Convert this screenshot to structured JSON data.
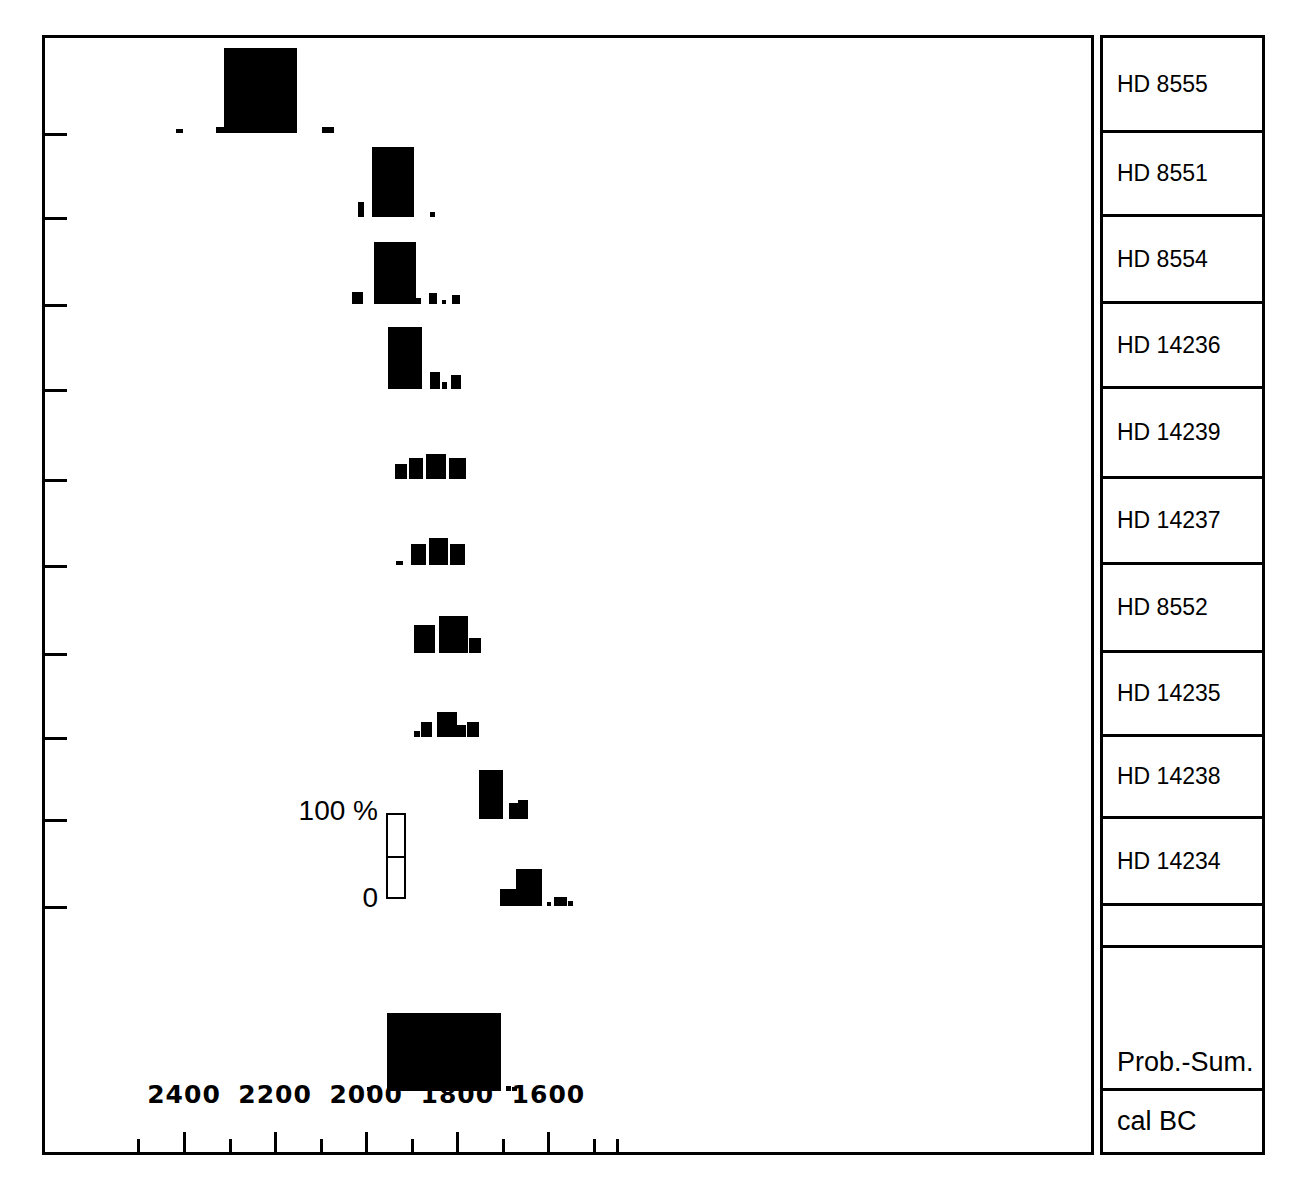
{
  "chart_data": {
    "type": "bar",
    "title": "",
    "subtitle": "",
    "xlabel": "cal BC",
    "ylabel": "",
    "xlim": [
      2500,
      1450
    ],
    "x_axis_direction": "reversed",
    "xticks_major": [
      2400,
      2200,
      2000,
      1800,
      1600
    ],
    "xticks_minor": [
      2300,
      2100,
      1900,
      1700,
      1500
    ],
    "grid": false,
    "legend_position": "inside-left",
    "scale_legend": {
      "top_label": "100 %",
      "bottom_label": "0",
      "midline": true
    },
    "series": [
      {
        "name": "HD 8555",
        "bars": [
          {
            "start": 2418,
            "end": 2403,
            "prob": 4
          },
          {
            "start": 2330,
            "end": 2312,
            "prob": 7
          },
          {
            "start": 2312,
            "end": 2153,
            "prob": 100
          },
          {
            "start": 2098,
            "end": 2071,
            "prob": 7
          }
        ]
      },
      {
        "name": "HD 8551",
        "bars": [
          {
            "start": 2017,
            "end": 2005,
            "prob": 22
          },
          {
            "start": 1988,
            "end": 1895,
            "prob": 100
          },
          {
            "start": 1859,
            "end": 1849,
            "prob": 7
          }
        ]
      },
      {
        "name": "HD 8554",
        "bars": [
          {
            "start": 2031,
            "end": 2008,
            "prob": 20
          },
          {
            "start": 1982,
            "end": 1890,
            "prob": 100
          },
          {
            "start": 1890,
            "end": 1879,
            "prob": 10
          },
          {
            "start": 1862,
            "end": 1844,
            "prob": 18
          },
          {
            "start": 1834,
            "end": 1829,
            "prob": 5
          },
          {
            "start": 1811,
            "end": 1794,
            "prob": 15
          }
        ]
      },
      {
        "name": "HD 14236",
        "bars": [
          {
            "start": 1952,
            "end": 1878,
            "prob": 100
          },
          {
            "start": 1859,
            "end": 1839,
            "prob": 27
          },
          {
            "start": 1833,
            "end": 1822,
            "prob": 12
          },
          {
            "start": 1814,
            "end": 1792,
            "prob": 22
          }
        ]
      },
      {
        "name": "HD 14239",
        "bars": [
          {
            "start": 1936,
            "end": 1911,
            "prob": 38
          },
          {
            "start": 1906,
            "end": 1875,
            "prob": 52
          },
          {
            "start": 1868,
            "end": 1824,
            "prob": 62
          },
          {
            "start": 1819,
            "end": 1781,
            "prob": 52
          }
        ]
      },
      {
        "name": "HD 14237",
        "bars": [
          {
            "start": 1935,
            "end": 1919,
            "prob": 8
          },
          {
            "start": 1902,
            "end": 1869,
            "prob": 50
          },
          {
            "start": 1862,
            "end": 1821,
            "prob": 65
          },
          {
            "start": 1816,
            "end": 1782,
            "prob": 50
          }
        ]
      },
      {
        "name": "HD 8552",
        "bars": [
          {
            "start": 1895,
            "end": 1848,
            "prob": 58
          },
          {
            "start": 1840,
            "end": 1777,
            "prob": 78
          },
          {
            "start": 1775,
            "end": 1747,
            "prob": 32
          }
        ]
      },
      {
        "name": "HD 14235",
        "bars": [
          {
            "start": 1895,
            "end": 1882,
            "prob": 15
          },
          {
            "start": 1879,
            "end": 1855,
            "prob": 38
          },
          {
            "start": 1844,
            "end": 1800,
            "prob": 62
          },
          {
            "start": 1800,
            "end": 1780,
            "prob": 30
          },
          {
            "start": 1778,
            "end": 1753,
            "prob": 38
          }
        ]
      },
      {
        "name": "HD 14238",
        "bars": [
          {
            "start": 1752,
            "end": 1700,
            "prob": 85
          },
          {
            "start": 1686,
            "end": 1667,
            "prob": 27
          },
          {
            "start": 1666,
            "end": 1645,
            "prob": 32
          }
        ]
      },
      {
        "name": "HD 14234",
        "bars": [
          {
            "start": 1706,
            "end": 1672,
            "prob": 32
          },
          {
            "start": 1672,
            "end": 1615,
            "prob": 72
          },
          {
            "start": 1602,
            "end": 1595,
            "prob": 6
          },
          {
            "start": 1587,
            "end": 1559,
            "prob": 18
          },
          {
            "start": 1557,
            "end": 1546,
            "prob": 10
          }
        ]
      },
      {
        "name": "Prob.-Sum.",
        "bars": [
          {
            "start": 1999,
            "end": 1990,
            "prob": 5
          },
          {
            "start": 1955,
            "end": 1705,
            "prob": 100
          },
          {
            "start": 1694,
            "end": 1681,
            "prob": 7
          },
          {
            "start": 1679,
            "end": 1670,
            "prob": 5
          }
        ]
      }
    ]
  },
  "axis": {
    "xlabel": "cal BC",
    "tick_labels": [
      "2400",
      "2200",
      "2000",
      "1800",
      "1600"
    ]
  },
  "legend": {
    "scale_top": "100 %",
    "scale_bottom": "0"
  },
  "row_labels": [
    "HD 8555",
    "HD 8551",
    "HD 8554",
    "HD 14236",
    "HD 14239",
    "HD 14237",
    "HD 8552",
    "HD 14235",
    "HD 14238",
    "HD 14234",
    "",
    "Prob.-Sum.",
    "cal BC"
  ]
}
